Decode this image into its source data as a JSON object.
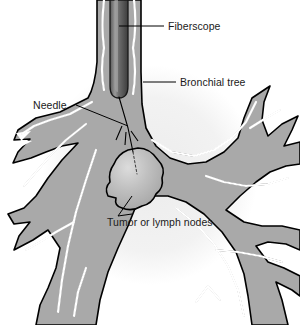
{
  "figure": {
    "background_color": "#ffffff",
    "halo_color": "#f0f0f0",
    "airway_fill_color": "#a9a9a9",
    "airway_outline_color": "#000000",
    "lumen_color": "#ffffff",
    "scope_dark_color": "#4a4a4a",
    "scope_highlight_color": "#8d8d8d",
    "tumor_fill_color": "#b4b4b4",
    "tumor_highlight_color": "#d8d8d8",
    "label_color": "#1a1a1a"
  },
  "labels": [
    {
      "id": "fiberscope",
      "text": "Fiberscope",
      "x": 168,
      "y": 29,
      "anchor": "start"
    },
    {
      "id": "bronchial-tree",
      "text": "Bronchial tree",
      "x": 180,
      "y": 85,
      "anchor": "start"
    },
    {
      "id": "needle",
      "text": "Needle",
      "x": 33,
      "y": 108,
      "anchor": "start"
    },
    {
      "id": "tumor-or-lymph-nodes",
      "text": "Tumor or lymph nodes",
      "x": 107,
      "y": 225,
      "anchor": "start"
    }
  ],
  "anatomy": {
    "structures": [
      "main bronchus",
      "left bronchial branches",
      "right bronchial branches",
      "lower bronchial branches"
    ],
    "instrument": "flexible fiberscope with aspiration needle",
    "lesion": "tumor or lymph nodes adjacent to bronchial wall"
  }
}
